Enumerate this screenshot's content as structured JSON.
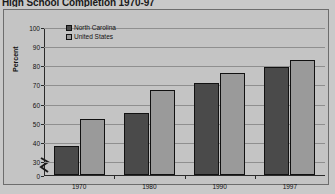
{
  "chart_data": {
    "type": "bar",
    "title": "High School Completion 1970-97",
    "xlabel": "",
    "ylabel": "Percent",
    "categories": [
      "1970",
      "1980",
      "1990",
      "1997"
    ],
    "series": [
      {
        "name": "North Carolina",
        "color": "#4a4a4a",
        "values": [
          38,
          55,
          70.5,
          79
        ]
      },
      {
        "name": "United States",
        "color": "#9a9a9a",
        "values": [
          52,
          67,
          76,
          83
        ]
      }
    ],
    "ylim": [
      0,
      100
    ],
    "yticks": [
      "0",
      "30",
      "40",
      "50",
      "60",
      "70",
      "80",
      "90",
      "100"
    ],
    "axis_break": true,
    "grid": true,
    "legend_position": "top-left-inside"
  },
  "colors": {
    "background": "#c9c9c9",
    "plot_background": "#c4c4c4",
    "frame_border": "#6d6d6d",
    "gridline": "#8f8f8f",
    "axis": "#2a2a2a"
  }
}
